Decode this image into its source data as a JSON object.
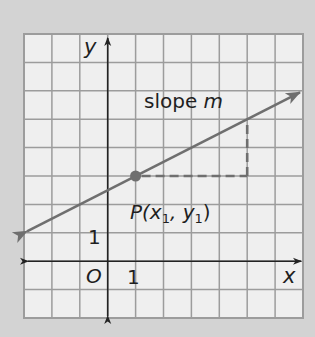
{
  "diagram": {
    "type": "coordinate-plane",
    "grid": {
      "x_min": -3,
      "x_max": 7,
      "y_min": -2,
      "y_max": 8,
      "step": 1
    },
    "axes": {
      "x_label": "x",
      "y_label": "y",
      "origin_label": "O",
      "x_tick_label": "1",
      "y_tick_label": "1"
    },
    "line": {
      "slope": 0.5,
      "intercept": 2.5,
      "label_text": "slope ",
      "label_var": "m",
      "arrows": "both"
    },
    "point": {
      "x": 1,
      "y": 3,
      "label_main": "P(x",
      "label_sub1": "1",
      "label_mid": ", y",
      "label_sub2": "1",
      "label_end": ")"
    },
    "slope_triangle": {
      "from": [
        1,
        3
      ],
      "corner": [
        5,
        3
      ],
      "to": [
        5,
        5
      ],
      "style": "dashed"
    },
    "colors": {
      "background": "#d3d3d3",
      "grid_fill": "#efefef",
      "grid_line": "#9c9c9c",
      "axis": "#232323",
      "line": "#6f6f6f",
      "text": "#1f1f1f"
    }
  }
}
